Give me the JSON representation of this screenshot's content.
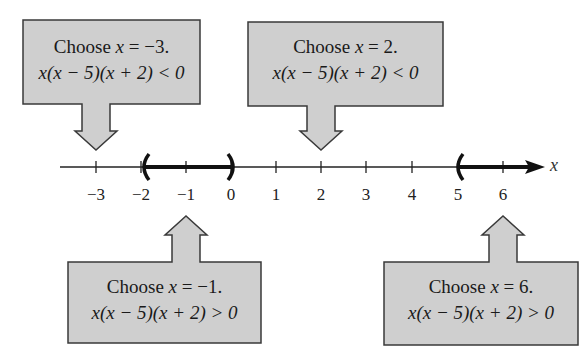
{
  "number_line": {
    "variable": "x",
    "ticks": [
      {
        "value": -3,
        "label": "−3",
        "x": 96
      },
      {
        "value": -2,
        "label": "−2",
        "x": 141
      },
      {
        "value": -1,
        "label": "−1",
        "x": 186
      },
      {
        "value": 0,
        "label": "0",
        "x": 231
      },
      {
        "value": 1,
        "label": "1",
        "x": 276
      },
      {
        "value": 2,
        "label": "2",
        "x": 321
      },
      {
        "value": 3,
        "label": "3",
        "x": 366
      },
      {
        "value": 4,
        "label": "4",
        "x": 412
      },
      {
        "value": 5,
        "label": "5",
        "x": 458
      },
      {
        "value": 6,
        "label": "6",
        "x": 503
      }
    ],
    "solution_intervals": [
      "(-2, 0)",
      "(5, ∞)"
    ]
  },
  "callouts": [
    {
      "id": "test-neg3",
      "line1_prefix": "Choose ",
      "line1_var": "x",
      "line1_suffix": " = −3.",
      "line2": "x(x − 5)(x + 2) < 0",
      "points_to": -3
    },
    {
      "id": "test-2",
      "line1_prefix": "Choose ",
      "line1_var": "x",
      "line1_suffix": " = 2.",
      "line2": "x(x − 5)(x + 2) < 0",
      "points_to": 2
    },
    {
      "id": "test-neg1",
      "line1_prefix": "Choose ",
      "line1_var": "x",
      "line1_suffix": " = −1.",
      "line2": "x(x − 5)(x + 2) > 0",
      "points_to": -1
    },
    {
      "id": "test-6",
      "line1_prefix": "Choose ",
      "line1_var": "x",
      "line1_suffix": " = 6.",
      "line2": "x(x − 5)(x + 2) > 0",
      "points_to": 6
    }
  ],
  "colors": {
    "box_fill": "#cfcfcf",
    "box_stroke": "#3a3a3a",
    "line": "#222222"
  }
}
